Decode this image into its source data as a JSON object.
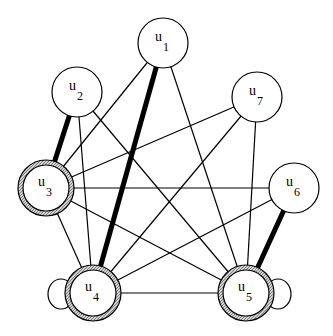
{
  "diagram": {
    "type": "graph",
    "nodes": [
      {
        "id": "u1",
        "label": "u",
        "sub": "1",
        "x": 163,
        "y": 43,
        "r": 25,
        "highlighted": false
      },
      {
        "id": "u2",
        "label": "u",
        "sub": "2",
        "x": 77,
        "y": 92,
        "r": 25,
        "highlighted": false
      },
      {
        "id": "u3",
        "label": "u",
        "sub": "3",
        "x": 46,
        "y": 188,
        "r": 28,
        "highlighted": true
      },
      {
        "id": "u4",
        "label": "u",
        "sub": "4",
        "x": 93,
        "y": 293,
        "r": 28,
        "highlighted": true,
        "self_loop": "left"
      },
      {
        "id": "u5",
        "label": "u",
        "sub": "5",
        "x": 246,
        "y": 293,
        "r": 28,
        "highlighted": true,
        "self_loop": "right"
      },
      {
        "id": "u6",
        "label": "u",
        "sub": "6",
        "x": 294,
        "y": 188,
        "r": 25,
        "highlighted": false
      },
      {
        "id": "u7",
        "label": "u",
        "sub": "7",
        "x": 257,
        "y": 97,
        "r": 25,
        "highlighted": false
      }
    ],
    "edges": [
      {
        "from": "u1",
        "to": "u4",
        "weight": "thick"
      },
      {
        "from": "u1",
        "to": "u3",
        "weight": "thin"
      },
      {
        "from": "u1",
        "to": "u5",
        "weight": "thin"
      },
      {
        "from": "u2",
        "to": "u3",
        "weight": "thick"
      },
      {
        "from": "u2",
        "to": "u4",
        "weight": "thin"
      },
      {
        "from": "u2",
        "to": "u5",
        "weight": "thin"
      },
      {
        "from": "u7",
        "to": "u3",
        "weight": "thin"
      },
      {
        "from": "u7",
        "to": "u4",
        "weight": "thin"
      },
      {
        "from": "u7",
        "to": "u5",
        "weight": "thin"
      },
      {
        "from": "u3",
        "to": "u6",
        "weight": "thin"
      },
      {
        "from": "u3",
        "to": "u4",
        "weight": "thin"
      },
      {
        "from": "u3",
        "to": "u5",
        "weight": "thin"
      },
      {
        "from": "u6",
        "to": "u4",
        "weight": "thin"
      },
      {
        "from": "u6",
        "to": "u5",
        "weight": "thick"
      },
      {
        "from": "u4",
        "to": "u5",
        "weight": "thin"
      }
    ],
    "colors": {
      "stroke": "#000000",
      "fill": "#ffffff",
      "ring": "#a8a8a8"
    }
  }
}
